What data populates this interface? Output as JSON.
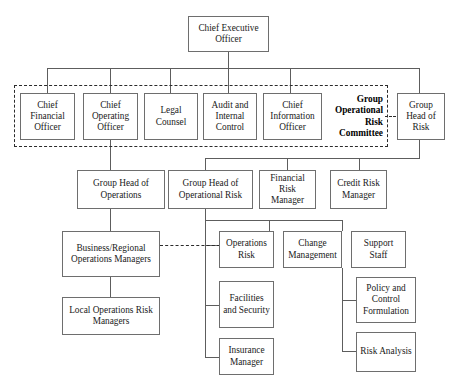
{
  "chart_title": "Group Operational Risk Governance Structure",
  "nodes": {
    "ceo": "Chief Executive Officer",
    "cfo": "Chief Financial Officer",
    "coo": "Chief Operating Officer",
    "legal": "Legal Counsel",
    "audit": "Audit and Internal Control",
    "cio": "Chief Information Officer",
    "committee": "Group Operational Risk Committee",
    "group_head_risk": "Group Head of Risk",
    "group_head_ops": "Group Head of Operations",
    "group_head_op_risk": "Group Head of Operational Risk",
    "financial_risk_mgr": "Financial Risk Manager",
    "credit_risk_mgr": "Credit Risk Manager",
    "biz_regional_ops": "Business/Regional Operations Managers",
    "ops_risk": "Operations Risk",
    "change_mgmt": "Change Management",
    "support_staff": "Support Staff",
    "local_ops_risk": "Local Operations Risk Managers",
    "facilities": "Facilities and Security",
    "policy_control": "Policy and Control Formulation",
    "insurance_mgr": "Insurance Manager",
    "risk_analysis": "Risk Analysis"
  },
  "styles": {
    "box_border_color": "#6e6e6e",
    "line_color": "#5d5d5d",
    "dashed_color": "#2b2b2b",
    "background": "#ffffff",
    "text_color": "#1a1a1a"
  }
}
